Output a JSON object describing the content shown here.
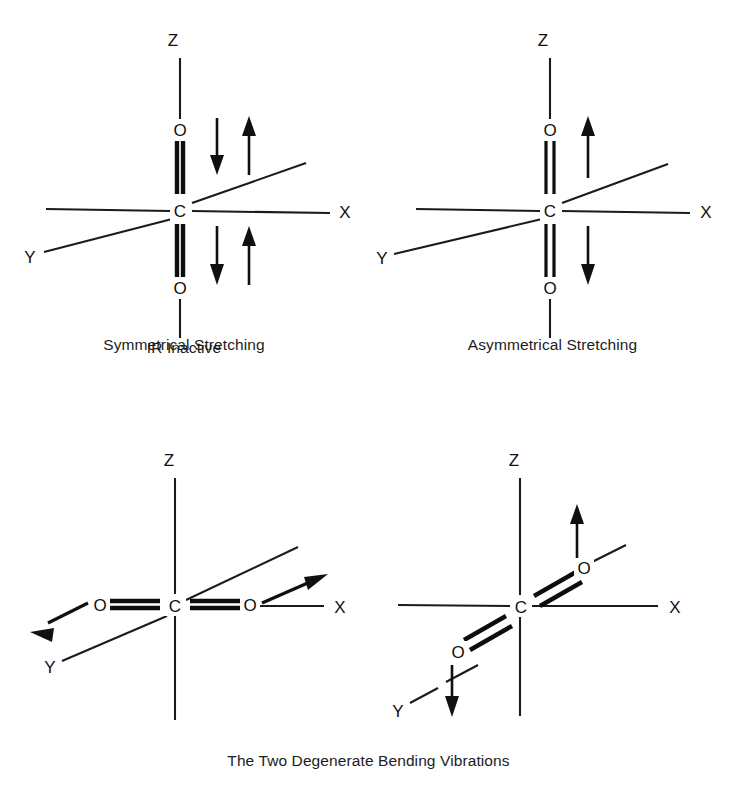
{
  "figure": {
    "molecule_atoms": {
      "center": "C",
      "terminal": "O"
    },
    "axes": {
      "x": "X",
      "y": "Y",
      "z": "Z"
    },
    "colors": {
      "ink": "#101010",
      "background": "#ffffff"
    }
  },
  "panels": [
    {
      "id": "symmetrical-stretching",
      "caption_line1": "Symmetrical Stretching",
      "caption_line2": "IR Inactive",
      "molecule_orientation": "vertical-along-z",
      "atoms": {
        "top": "O",
        "center": "C",
        "bottom": "O"
      },
      "axis_labels": {
        "z": "Z",
        "x": "X",
        "y": "Y"
      },
      "arrows": [
        {
          "name": "top-down-arrow",
          "direction": "down"
        },
        {
          "name": "top-up-arrow",
          "direction": "up"
        },
        {
          "name": "bottom-down-arrow",
          "direction": "down"
        },
        {
          "name": "bottom-up-arrow",
          "direction": "up"
        }
      ]
    },
    {
      "id": "asymmetrical-stretching",
      "caption_line1": "Asymmetrical Stretching",
      "caption_line2": "",
      "molecule_orientation": "vertical-along-z",
      "atoms": {
        "top": "O",
        "center": "C",
        "bottom": "O"
      },
      "axis_labels": {
        "z": "Z",
        "x": "X",
        "y": "Y"
      },
      "arrows": [
        {
          "name": "top-up-arrow",
          "direction": "up"
        },
        {
          "name": "bottom-down-arrow",
          "direction": "down"
        }
      ]
    },
    {
      "id": "bending-vibration-in-plane",
      "caption_line1": "",
      "caption_line2": "",
      "molecule_orientation": "horizontal-along-x",
      "atoms": {
        "left": "O",
        "center": "C",
        "right": "O"
      },
      "axis_labels": {
        "z": "Z",
        "x": "X",
        "y": "Y"
      },
      "arrows": [
        {
          "name": "left-oxygen-arrow",
          "direction": "down-left"
        },
        {
          "name": "right-oxygen-arrow",
          "direction": "up-right"
        }
      ]
    },
    {
      "id": "bending-vibration-out-of-plane",
      "caption_line1": "",
      "caption_line2": "",
      "molecule_orientation": "diagonal-along-y",
      "atoms": {
        "upper": "O",
        "center": "C",
        "lower": "O"
      },
      "axis_labels": {
        "z": "Z",
        "x": "X",
        "y": "Y"
      },
      "arrows": [
        {
          "name": "upper-oxygen-arrow",
          "direction": "up"
        },
        {
          "name": "lower-oxygen-arrow",
          "direction": "down"
        }
      ]
    }
  ],
  "bottom_caption": "The Two Degenerate Bending Vibrations"
}
